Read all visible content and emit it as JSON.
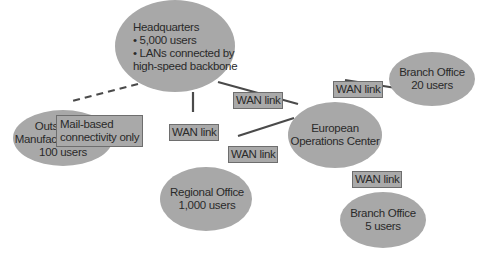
{
  "diagram": {
    "type": "network-topology",
    "colors": {
      "node_fill": "#a8a8a8",
      "label_fill": "#a9a9a9",
      "edge": "#4a4a4a",
      "text": "#2a2a2a"
    },
    "nodes": {
      "hq": {
        "title": "Headquarters",
        "line1": "• 5,000 users",
        "line2": "• LANs connected by",
        "line3": "high-speed backbone"
      },
      "branch20": {
        "title": "Branch Office",
        "users": "20 users"
      },
      "european": {
        "title": "European",
        "title2": "Operations Center"
      },
      "outsourced": {
        "title": "Outsourced",
        "title2": "Manufacturing Plant",
        "users": "100 users"
      },
      "regional": {
        "title": "Regional Office",
        "users": "1,000 users"
      },
      "branch5": {
        "title": "Branch Office",
        "users": "5 users"
      }
    },
    "edges": {
      "hq_european": {
        "label": "WAN link",
        "style": "solid"
      },
      "hq_regional": {
        "label": "WAN link",
        "style": "solid"
      },
      "regional_european": {
        "label": "WAN link",
        "style": "solid"
      },
      "european_branch20": {
        "label": "WAN link",
        "style": "solid"
      },
      "european_branch5": {
        "label": "WAN link",
        "style": "solid"
      },
      "hq_outsourced": {
        "label1": "Mail-based",
        "label2": "connectivity only",
        "style": "dashed"
      }
    }
  }
}
